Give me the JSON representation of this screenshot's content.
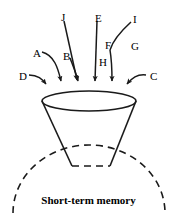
{
  "figure": {
    "caption": "Short-term memory",
    "stroke_color": "#1a1a1a",
    "background_color": "#ffffff",
    "labels": [
      {
        "id": "A",
        "text": "A",
        "x": 33,
        "y": 48
      },
      {
        "id": "B",
        "text": "B",
        "x": 63,
        "y": 51
      },
      {
        "id": "C",
        "text": "C",
        "x": 150,
        "y": 71
      },
      {
        "id": "D",
        "text": "D",
        "x": 19,
        "y": 71
      },
      {
        "id": "E",
        "text": "E",
        "x": 95,
        "y": 13
      },
      {
        "id": "F",
        "text": "F",
        "x": 105,
        "y": 40
      },
      {
        "id": "G",
        "text": "G",
        "x": 131,
        "y": 41
      },
      {
        "id": "H",
        "text": "H",
        "x": 99,
        "y": 57
      },
      {
        "id": "I",
        "text": "I",
        "x": 133,
        "y": 14
      },
      {
        "id": "J",
        "text": "J",
        "x": 61,
        "y": 12
      }
    ],
    "shapes": {
      "funnel_rim_ellipse": {
        "cx": 89,
        "cy": 101,
        "rx": 47,
        "ry": 10
      },
      "funnel_bottom": {
        "left_x": 72,
        "right_x": 110,
        "y": 166
      },
      "memory_arc": {
        "cx": 89,
        "cy": 213,
        "rx": 76,
        "ry": 68
      }
    },
    "arrow_targets": [
      47,
      62,
      79,
      95,
      112,
      126
    ]
  }
}
